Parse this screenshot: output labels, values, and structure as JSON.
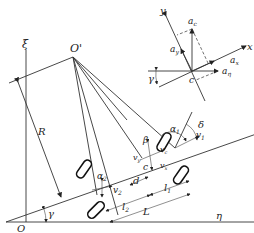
{
  "diagram": {
    "type": "vehicle-steering-kinematics",
    "ground_axes": {
      "origin": "O",
      "vertical": "ξ",
      "horizontal": "η"
    },
    "turn_center": "O'",
    "radius_label": "R",
    "heading_angle": "γ",
    "inset": {
      "axes": {
        "x": "x",
        "y": "y"
      },
      "center": "c",
      "vectors": [
        "a",
        "a",
        "a",
        "a"
      ],
      "subscripts": [
        "c",
        "y",
        "x",
        "η"
      ],
      "angle": "γ"
    },
    "vehicle": {
      "center_label": "c",
      "slip_angle": "β",
      "front_steer_angle": "δ",
      "front_slip_angle": "α",
      "front_slip_sub": "1",
      "rear_slip_angle": "α",
      "rear_slip_sub": "2",
      "velocities": {
        "front": "v",
        "front_sub": "1",
        "rear": "v",
        "rear_sub": "2",
        "center": "v",
        "center_sub": "c",
        "x": "v",
        "x_sub": "x",
        "y": "v",
        "y_sub": "y"
      },
      "dimensions": {
        "d": "d",
        "l1": "l",
        "l1_sub": "1",
        "l2": "l",
        "l2_sub": "2",
        "L": "L"
      }
    }
  }
}
